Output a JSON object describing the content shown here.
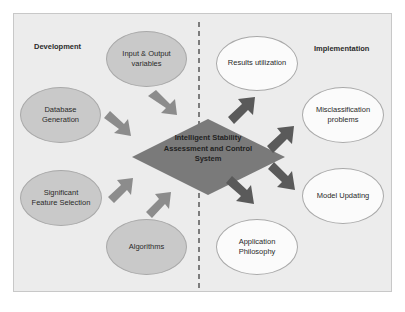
{
  "diagram": {
    "sections": {
      "left": "Development",
      "right": "Implementation"
    },
    "center": {
      "label": "Intelligent Stability\nAssessment and Control\nSystem",
      "color": "#7a7a7a"
    },
    "development_nodes": [
      {
        "label": "Input & Output\nvariables"
      },
      {
        "label": "Database\nGeneration"
      },
      {
        "label": "Significant\nFeature Selection"
      },
      {
        "label": "Algorithms"
      }
    ],
    "implementation_nodes": [
      {
        "label": "Results utilization"
      },
      {
        "label": "Misclassification\nproblems"
      },
      {
        "label": "Model Updating"
      },
      {
        "label": "Application\nPhilosophy"
      }
    ],
    "colors": {
      "panel_bg": "#ececec",
      "dev_node": "#c9c9c9",
      "impl_node": "#fbfbfb",
      "in_arrow": "#8c8c8c",
      "out_arrow": "#5a5a5a"
    },
    "caption": "Fig. 1.1. Overall framework..."
  }
}
